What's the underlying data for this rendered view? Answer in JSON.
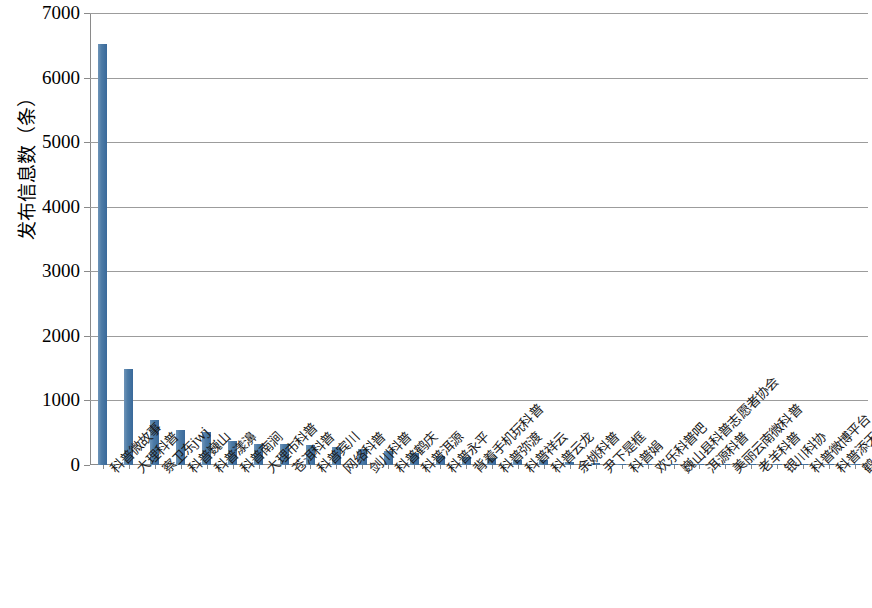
{
  "chart_data": {
    "type": "bar",
    "title": "",
    "xlabel": "",
    "ylabel": "发布信息数（条）",
    "ylim": [
      0,
      7000
    ],
    "ytick_step": 1000,
    "ytick_labels": [
      "0",
      "1000",
      "2000",
      "3000",
      "4000",
      "5000",
      "6000",
      "7000"
    ],
    "grid": true,
    "legend": false,
    "bar_color": "#4d7ba6",
    "categories": [
      "科普微故事",
      "大理科普",
      "察卫东jwj",
      "科普巍山",
      "科普漾濞",
      "科普南涧",
      "大理市科普",
      "苍洱科普",
      "科普宾川",
      "网络科普",
      "剑川科普",
      "科普鹤庆",
      "科普洱源",
      "科普永平",
      "背着手机玩科普",
      "科普弥渡",
      "科普祥云",
      "科普云龙",
      "余姚科普",
      "尹下是框",
      "科普娟",
      "欢乐科普吧",
      "巍山县科普志愿者协会",
      "洱源科普",
      "美丽云南微科普",
      "老羊科普",
      "银川科协",
      "科普微博平台",
      "科普添天乐",
      "鹤庆科普之光"
    ],
    "values": [
      6520,
      1480,
      700,
      540,
      510,
      375,
      330,
      320,
      310,
      280,
      250,
      215,
      190,
      145,
      120,
      110,
      75,
      70,
      40,
      30,
      22,
      18,
      12,
      10,
      9,
      8,
      7,
      6,
      5,
      4
    ]
  }
}
